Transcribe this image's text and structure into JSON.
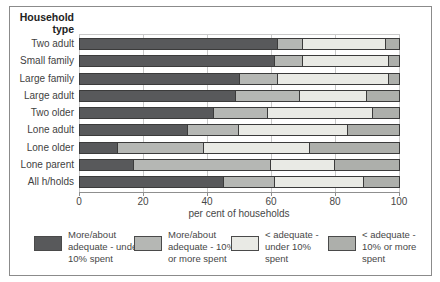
{
  "figure": {
    "header_line1": "Household",
    "header_line2": "type",
    "xlabel": "per cent of households"
  },
  "chart_data": {
    "type": "bar",
    "subtype": "horizontal-stacked",
    "orientation": "horizontal",
    "categories": [
      "Two adult",
      "Small family",
      "Large family",
      "Large adult",
      "Two older",
      "Lone adult",
      "Lone older",
      "Lone parent",
      "All h/holds"
    ],
    "series": [
      {
        "name": "More/about adequate - under 10% spent",
        "color": "#58595b",
        "values": [
          62,
          61,
          50,
          49,
          42,
          34,
          12,
          17,
          45
        ]
      },
      {
        "name": "More/about adequate - 10% or more spent",
        "color": "#b5b7b4",
        "values": [
          8,
          9,
          12,
          20,
          17,
          16,
          27,
          43,
          16
        ]
      },
      {
        "name": "< adequate - under 10% spent",
        "color": "#e9eae5",
        "values": [
          26,
          27,
          35,
          21,
          33,
          34,
          33,
          20,
          28
        ]
      },
      {
        "name": "< adequate - 10% or more spent",
        "color": "#adafab",
        "values": [
          4,
          3,
          3,
          10,
          8,
          16,
          28,
          20,
          11
        ]
      }
    ],
    "xlabel": "per cent of households",
    "xlim": [
      0,
      100
    ],
    "xticks": [
      0,
      20,
      40,
      60,
      80,
      100
    ],
    "grid": "vertical",
    "legend_position": "bottom"
  },
  "legend": {
    "items": [
      {
        "label": "More/about adequate - under 10% spent",
        "lines": [
          "More/about",
          "adequate - under",
          "10% spent"
        ],
        "color": "#58595b"
      },
      {
        "label": "More/about adequate - 10% or more spent",
        "lines": [
          "More/about",
          "adequate - 10%",
          "or more spent"
        ],
        "color": "#b5b7b4"
      },
      {
        "label": "< adequate - under 10% spent",
        "lines": [
          "< adequate -",
          "under 10%",
          "spent"
        ],
        "color": "#e9eae5"
      },
      {
        "label": "< adequate - 10% or more spent",
        "lines": [
          "< adequate -",
          "10% or more",
          "spent"
        ],
        "color": "#adafab"
      }
    ]
  }
}
